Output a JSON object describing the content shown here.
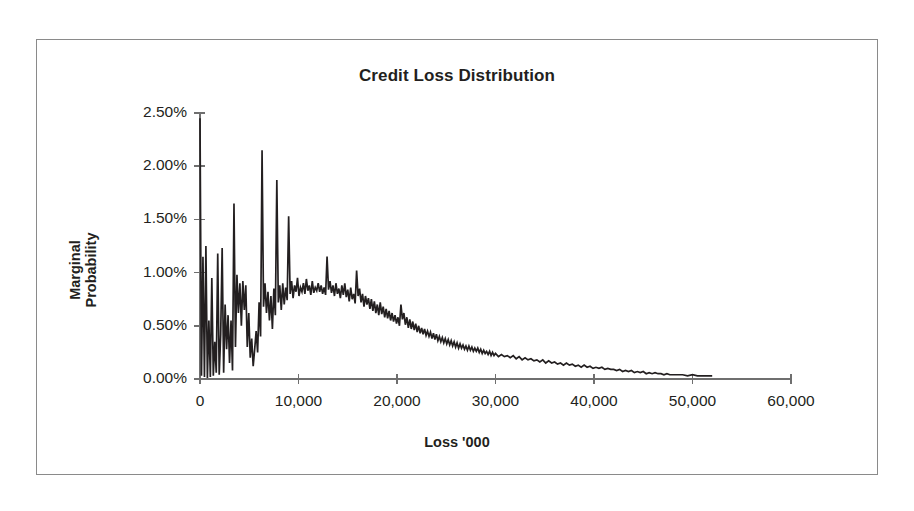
{
  "chart_data": {
    "type": "line",
    "title": "Credit Loss Distribution",
    "xlabel": "Loss '000",
    "ylabel": "Marginal Probability",
    "ylabel_line1": "Marginal",
    "ylabel_line2": "Probability",
    "xlim": [
      0,
      60000
    ],
    "ylim": [
      0,
      0.025
    ],
    "grid": false,
    "legend": "none",
    "line_color": "#231f20",
    "axis_color": "#6f6f6f",
    "frame_color": "#8a8a8a",
    "text_color": "#231f20",
    "xticks": [
      0,
      10000,
      20000,
      30000,
      40000,
      50000,
      60000
    ],
    "xtick_labels": [
      "0",
      "10,000",
      "20,000",
      "30,000",
      "40,000",
      "50,000",
      "60,000"
    ],
    "yticks": [
      0,
      0.005,
      0.01,
      0.015,
      0.02,
      0.025
    ],
    "ytick_labels": [
      "0.00%",
      "0.50%",
      "1.00%",
      "1.50%",
      "2.00%",
      "2.50%"
    ],
    "x": [
      0,
      150,
      300,
      450,
      600,
      750,
      900,
      1050,
      1200,
      1350,
      1500,
      1650,
      1800,
      1950,
      2100,
      2250,
      2400,
      2550,
      2700,
      2850,
      3000,
      3150,
      3300,
      3450,
      3600,
      3750,
      3900,
      4050,
      4200,
      4350,
      4500,
      4650,
      4800,
      4950,
      5100,
      5250,
      5400,
      5550,
      5700,
      5850,
      6000,
      6150,
      6300,
      6450,
      6600,
      6750,
      6900,
      7050,
      7200,
      7350,
      7500,
      7650,
      7800,
      7950,
      8100,
      8250,
      8400,
      8550,
      8700,
      8850,
      9000,
      9150,
      9300,
      9450,
      9600,
      9750,
      9900,
      10050,
      10200,
      10350,
      10500,
      10650,
      10800,
      10950,
      11100,
      11250,
      11400,
      11550,
      11700,
      11850,
      12000,
      12150,
      12300,
      12450,
      12600,
      12750,
      12900,
      13050,
      13200,
      13350,
      13500,
      13650,
      13800,
      13950,
      14100,
      14250,
      14400,
      14550,
      14700,
      14850,
      15000,
      15150,
      15300,
      15450,
      15600,
      15750,
      15900,
      16050,
      16200,
      16350,
      16500,
      16650,
      16800,
      16950,
      17100,
      17250,
      17400,
      17550,
      17700,
      17850,
      18000,
      18150,
      18300,
      18450,
      18600,
      18750,
      18900,
      19050,
      19200,
      19350,
      19500,
      19650,
      19800,
      19950,
      20100,
      20250,
      20400,
      20550,
      20700,
      20850,
      21000,
      21150,
      21300,
      21450,
      21600,
      21750,
      21900,
      22050,
      22200,
      22350,
      22500,
      22650,
      22800,
      22950,
      23100,
      23250,
      23400,
      23550,
      23700,
      23850,
      24000,
      24150,
      24300,
      24450,
      24600,
      24750,
      24900,
      25050,
      25200,
      25350,
      25500,
      25650,
      25800,
      25950,
      26100,
      26250,
      26400,
      26550,
      26700,
      26850,
      27000,
      27150,
      27300,
      27450,
      27600,
      27750,
      27900,
      28050,
      28200,
      28350,
      28500,
      28650,
      28800,
      28950,
      29100,
      29250,
      29400,
      29550,
      29700,
      29850,
      30000,
      30300,
      30600,
      30900,
      31200,
      31500,
      31800,
      32100,
      32400,
      32700,
      33000,
      33300,
      33600,
      33900,
      34200,
      34500,
      34800,
      35100,
      35400,
      35700,
      36000,
      36300,
      36600,
      36900,
      37200,
      37500,
      37800,
      38100,
      38400,
      38700,
      39000,
      39300,
      39600,
      39900,
      40200,
      40500,
      40800,
      41100,
      41400,
      41700,
      42000,
      42300,
      42600,
      42900,
      43200,
      43500,
      43800,
      44100,
      44400,
      44700,
      45000,
      45300,
      45600,
      45900,
      46200,
      46500,
      46800,
      47100,
      47400,
      47700,
      48000,
      48500,
      49000,
      49500,
      50000,
      50500,
      51000,
      51500,
      52000
    ],
    "y": [
      0.0245,
      0.0003,
      0.0115,
      0.0002,
      0.0125,
      0.0001,
      0.0055,
      0.0002,
      0.0095,
      0.0003,
      0.0035,
      0.0006,
      0.0118,
      0.0004,
      0.0042,
      0.0123,
      0.0006,
      0.007,
      0.0028,
      0.006,
      0.0015,
      0.0055,
      0.0008,
      0.0165,
      0.003,
      0.0098,
      0.0062,
      0.009,
      0.005,
      0.0092,
      0.0065,
      0.0088,
      0.003,
      0.0062,
      0.002,
      0.0038,
      0.0012,
      0.0028,
      0.0045,
      0.0025,
      0.0072,
      0.004,
      0.0215,
      0.0068,
      0.009,
      0.0062,
      0.0082,
      0.0055,
      0.0078,
      0.0047,
      0.0085,
      0.006,
      0.0187,
      0.0072,
      0.0088,
      0.0065,
      0.009,
      0.007,
      0.0086,
      0.0074,
      0.0153,
      0.008,
      0.0092,
      0.0076,
      0.0088,
      0.0082,
      0.0095,
      0.0078,
      0.0086,
      0.0082,
      0.009,
      0.008,
      0.0094,
      0.0083,
      0.0088,
      0.0079,
      0.0092,
      0.0081,
      0.0086,
      0.0083,
      0.009,
      0.0082,
      0.0088,
      0.008,
      0.0086,
      0.0079,
      0.0115,
      0.0084,
      0.0092,
      0.0081,
      0.0088,
      0.0078,
      0.009,
      0.008,
      0.0085,
      0.0076,
      0.0088,
      0.0079,
      0.009,
      0.0077,
      0.0084,
      0.0073,
      0.0086,
      0.0075,
      0.008,
      0.0071,
      0.0102,
      0.0078,
      0.0085,
      0.0072,
      0.008,
      0.0068,
      0.0078,
      0.007,
      0.0076,
      0.0066,
      0.0075,
      0.0064,
      0.0073,
      0.0062,
      0.007,
      0.006,
      0.0072,
      0.0061,
      0.0068,
      0.0058,
      0.0066,
      0.0057,
      0.0064,
      0.0055,
      0.0062,
      0.0054,
      0.006,
      0.0052,
      0.0058,
      0.005,
      0.007,
      0.0056,
      0.0062,
      0.0051,
      0.0058,
      0.0048,
      0.0056,
      0.0047,
      0.0054,
      0.0046,
      0.0052,
      0.0044,
      0.005,
      0.0043,
      0.0048,
      0.0042,
      0.0047,
      0.0041,
      0.0045,
      0.004,
      0.0044,
      0.0038,
      0.0043,
      0.0037,
      0.0042,
      0.0036,
      0.004,
      0.0035,
      0.0039,
      0.0034,
      0.0038,
      0.0033,
      0.0037,
      0.0032,
      0.0036,
      0.0031,
      0.0035,
      0.003,
      0.0034,
      0.0029,
      0.0033,
      0.0029,
      0.0032,
      0.0028,
      0.0031,
      0.0027,
      0.0031,
      0.0027,
      0.003,
      0.0026,
      0.0029,
      0.0026,
      0.0029,
      0.0025,
      0.0028,
      0.0024,
      0.0027,
      0.0024,
      0.0026,
      0.0023,
      0.0026,
      0.0022,
      0.0025,
      0.0022,
      0.0024,
      0.0021,
      0.0023,
      0.0021,
      0.0022,
      0.002,
      0.0022,
      0.0019,
      0.0021,
      0.0018,
      0.002,
      0.0018,
      0.0019,
      0.0017,
      0.0018,
      0.0016,
      0.0018,
      0.0015,
      0.0017,
      0.0015,
      0.0016,
      0.0014,
      0.0015,
      0.0013,
      0.0015,
      0.0013,
      0.0014,
      0.0012,
      0.0013,
      0.0011,
      0.0013,
      0.0011,
      0.0012,
      0.001,
      0.0011,
      0.001,
      0.0011,
      0.0009,
      0.001,
      0.0009,
      0.0009,
      0.0008,
      0.0009,
      0.0007,
      0.0008,
      0.0007,
      0.0008,
      0.0006,
      0.0007,
      0.0006,
      0.0007,
      0.0005,
      0.0006,
      0.0005,
      0.0006,
      0.0005,
      0.0005,
      0.0004,
      0.0005,
      0.0004,
      0.0004,
      0.0004,
      0.0004,
      0.0003,
      0.0004,
      0.0003,
      0.0003,
      0.0003,
      0.0003,
      0.0002,
      0.0003,
      0.0002,
      0.0002,
      0.0002,
      0.0002,
      0.0002,
      0.0002,
      0.0001
    ]
  }
}
